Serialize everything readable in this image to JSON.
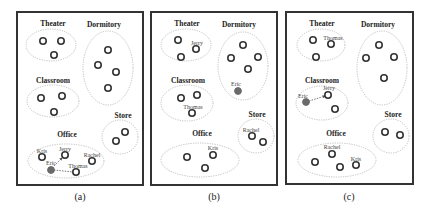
{
  "figure": {
    "panels": [
      {
        "caption": "(a)",
        "regions": {
          "theater": "Theater",
          "dormitory": "Dormitory",
          "classroom": "Classroom",
          "store": "Store",
          "office": "Office"
        },
        "agents": {
          "kris": "Kris",
          "jerry": "Jerry",
          "rachel": "Rachel",
          "eric": "Eric",
          "thomas": "Thomas"
        }
      },
      {
        "caption": "(b)",
        "regions": {
          "theater": "Theater",
          "dormitory": "Dormitory",
          "classroom": "Classroom",
          "store": "Store",
          "office": "Office"
        },
        "agents": {
          "jerry": "Jerry",
          "eric": "Eric",
          "thomas": "Thomas",
          "rachel": "Rachel",
          "kris": "Kris"
        }
      },
      {
        "caption": "(c)",
        "regions": {
          "theater": "Theater",
          "dormitory": "Dormitory",
          "classroom": "Classroom",
          "store": "Store",
          "office": "Office"
        },
        "agents": {
          "thomas": "Thomas",
          "jerry": "Jerry",
          "eric": "Eric",
          "rachel": "Rachel",
          "kris": "Kris"
        }
      }
    ],
    "colors": {
      "frame": "#333333",
      "region_outline": "#b8b8b8",
      "agent_ring": "#333333",
      "focus_agent": "#6a6a6a"
    }
  }
}
